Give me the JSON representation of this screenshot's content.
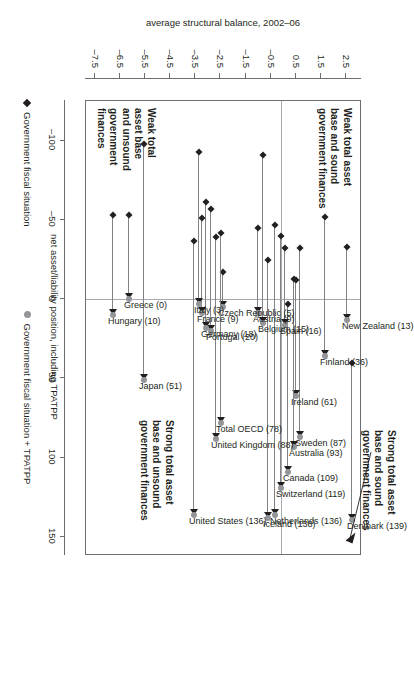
{
  "chart_data": {
    "type": "scatter",
    "title": "",
    "xlabel": "net asset/liability position, including TPATPP",
    "ylabel": "average structural balance, 2002–06",
    "xlim": [
      -125,
      162
    ],
    "ylim": [
      -7.9,
      3.1
    ],
    "xticks": [
      -100,
      -50,
      0,
      50,
      100,
      150
    ],
    "xticklabels": [
      "–100",
      "–50",
      "0",
      "50",
      "100",
      "150"
    ],
    "yticks": [
      2.5,
      1.5,
      0.5,
      -0.5,
      -1.5,
      -2.5,
      -3.5,
      -4.5,
      -5.5,
      -6.5,
      -7.5
    ],
    "yticklabels": [
      "2.5",
      "1.5",
      "0.5",
      "–0.5",
      "–1.5",
      "–2.5",
      "–3.5",
      "–4.5",
      "–5.5",
      "–6.5",
      "–7.5"
    ],
    "grid": false,
    "zero_lines": {
      "x": 0,
      "y": 0
    },
    "legend": {
      "position": "below-axis",
      "entries": [
        {
          "label": "Government fiscal situation",
          "marker": "diamond",
          "color": "#231f20"
        },
        {
          "label": "Government fiscal situation + TPATPP",
          "marker": "circle",
          "color": "#939598"
        }
      ]
    },
    "series": [
      {
        "name": "Government fiscal situation",
        "marker": "diamond",
        "color": "#231f20"
      },
      {
        "name": "Government fiscal situation + TPATPP",
        "marker": "circle",
        "color": "#939598"
      }
    ],
    "points": [
      {
        "label": "Denmark (139)",
        "x_start": 40,
        "x_end": 139,
        "y": 2.8
      },
      {
        "label": "New Zealand (13)",
        "x_start": -33,
        "x_end": 13,
        "y": 2.6
      },
      {
        "label": "Finland (36)",
        "x_start": -52,
        "x_end": 36,
        "y": 1.7
      },
      {
        "label": "Sweden (87)",
        "x_start": -32,
        "x_end": 87,
        "y": 0.7
      },
      {
        "label": "Ireland (61)",
        "x_start": -12,
        "x_end": 61,
        "y": 0.55
      },
      {
        "label": "Australia (93)",
        "x_start": -13,
        "x_end": 93,
        "y": 0.45
      },
      {
        "label": "Canada (109)",
        "x_start": 3,
        "x_end": 109,
        "y": 0.25
      },
      {
        "label": "Spain (16)",
        "x_start": -32,
        "x_end": 16,
        "y": 0.1
      },
      {
        "label": "Switzerland (119)",
        "x_start": -40,
        "x_end": 119,
        "y": -0.05
      },
      {
        "label": "Netherlands (136)",
        "x_start": -47,
        "x_end": 136,
        "y": -0.3
      },
      {
        "label": "Iceland (138)",
        "x_start": -25,
        "x_end": 138,
        "y": -0.55
      },
      {
        "label": "Belgium (15)",
        "x_start": -91,
        "x_end": 15,
        "y": -0.75
      },
      {
        "label": "Austria (9)",
        "x_start": -45,
        "x_end": 9,
        "y": -0.95
      },
      {
        "label": "Czech Republic (5)",
        "x_start": -17,
        "x_end": 5,
        "y": -2.35
      },
      {
        "label": "Total OECD (78)",
        "x_start": -42,
        "x_end": 78,
        "y": -2.45
      },
      {
        "label": "United Kingdom (88)",
        "x_start": -39,
        "x_end": 88,
        "y": -2.65
      },
      {
        "label": "Portugal (20)",
        "x_start": -57,
        "x_end": 20,
        "y": -2.85
      },
      {
        "label": "Germany (18)",
        "x_start": -61,
        "x_end": 18,
        "y": -3.05
      },
      {
        "label": "France (9)",
        "x_start": -51,
        "x_end": 9,
        "y": -3.2
      },
      {
        "label": "Italy (3)",
        "x_start": -93,
        "x_end": 3,
        "y": -3.3
      },
      {
        "label": "United States (136)",
        "x_start": -37,
        "x_end": 136,
        "y": -3.5
      },
      {
        "label": "Japan (51)",
        "x_start": -98,
        "x_end": 51,
        "y": -5.5
      },
      {
        "label": "Greece (0)",
        "x_start": -53,
        "x_end": 0,
        "y": -6.1
      },
      {
        "label": "Hungary (10)",
        "x_start": -53,
        "x_end": 10,
        "y": -6.75
      }
    ],
    "annotations": [
      {
        "id": "q-top-left",
        "text": "Strong total asset\nbase and sound\ngovernment finances",
        "quadrant": "upper-right-outside",
        "arrow_to": "Denmark (139)"
      },
      {
        "id": "q-weak-sound",
        "text": "Weak total asset\nbase and sound\ngovernment finances",
        "quadrant": "upper-left"
      },
      {
        "id": "q-strong-uns",
        "text": "Strong total asset\nbase and unsound\ngovernment finances",
        "quadrant": "lower-right"
      },
      {
        "id": "q-weak-uns",
        "text": "Weak total\nasset base\nand unsound\ngovernment\nfinances",
        "quadrant": "lower-left"
      }
    ]
  }
}
